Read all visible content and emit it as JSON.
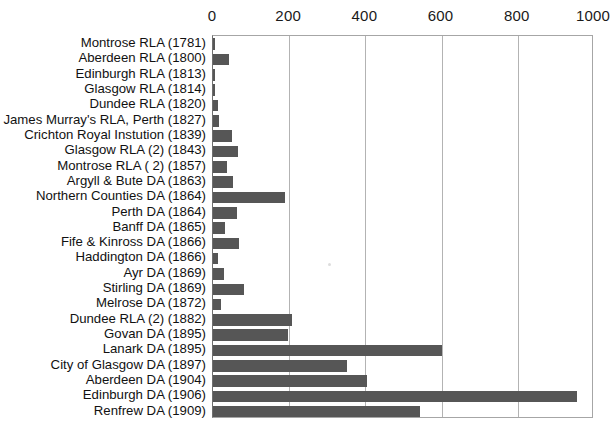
{
  "chart_data": {
    "type": "bar",
    "orientation": "horizontal",
    "title": "",
    "subtitle": "",
    "xlabel": "",
    "ylabel": "",
    "xlim": [
      0,
      1000
    ],
    "ylim": null,
    "grid": true,
    "gridlines_axis": "x",
    "legend": null,
    "legend_position": "none",
    "bar_color": "#565656",
    "gridline_color": "#b3b3b3",
    "axis_color": "#6f6f6f",
    "background_color": "#ffffff",
    "x_ticks": [
      0,
      200,
      400,
      600,
      800,
      1000
    ],
    "x_tick_labels": [
      "0",
      "200",
      "400",
      "600",
      "800",
      "1000"
    ],
    "categories": [
      "Montrose RLA (1781)",
      "Aberdeen RLA (1800)",
      "Edinburgh RLA (1813)",
      "Glasgow RLA (1814)",
      "Dundee RLA (1820)",
      "James Murray's RLA, Perth (1827)",
      "Crichton Royal Instution (1839)",
      "Glasgow RLA (2) (1843)",
      "Montrose RLA ( 2) (1857)",
      "Argyll & Bute DA (1863)",
      "Northern Counties DA (1864)",
      "Perth DA (1864)",
      "Banff DA (1865)",
      "Fife & Kinross DA (1866)",
      "Haddington DA (1866)",
      "Ayr DA (1869)",
      "Stirling DA (1869)",
      "Melrose DA (1872)",
      "Dundee RLA (2) (1882)",
      "Govan DA (1895)",
      "Lanark DA (1895)",
      "City of Glasgow DA (1897)",
      "Aberdeen DA (1904)",
      "Edinburgh DA (1906)",
      "Renfrew DA (1909)"
    ],
    "values": [
      6,
      43,
      5,
      5,
      14,
      16,
      49,
      66,
      36,
      53,
      188,
      64,
      31,
      67,
      14,
      30,
      81,
      22,
      208,
      198,
      601,
      352,
      403,
      956,
      543
    ]
  }
}
